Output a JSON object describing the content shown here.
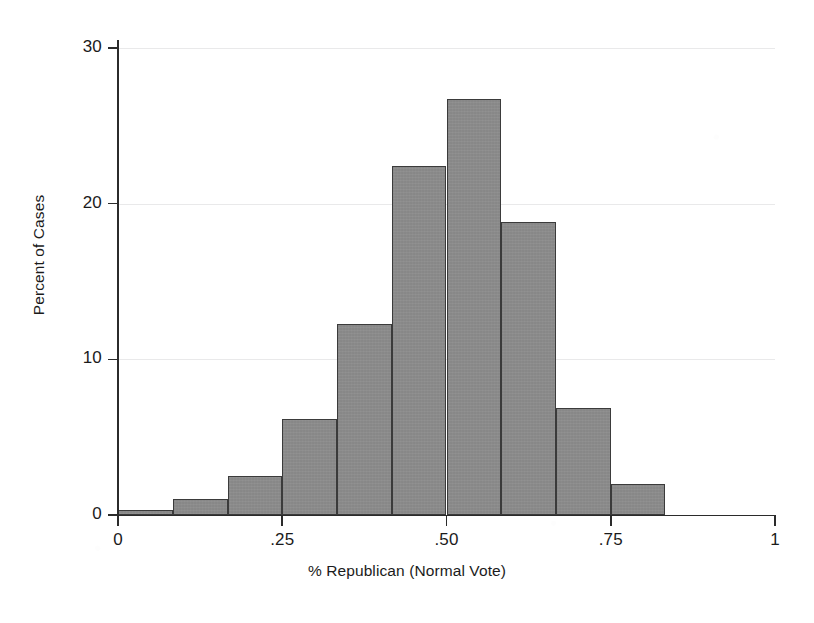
{
  "chart_data": {
    "type": "bar",
    "title": "",
    "subtitle": "",
    "xlabel": "% Republican (Normal Vote)",
    "ylabel": "Percent of Cases",
    "xlim": [
      0,
      1
    ],
    "ylim": [
      0,
      30
    ],
    "grid": true,
    "legend": null,
    "bin_width": 0.0833,
    "x_ticks": [
      {
        "value": 0,
        "label": "0"
      },
      {
        "value": 0.25,
        "label": ".25"
      },
      {
        "value": 0.5,
        "label": ".50"
      },
      {
        "value": 0.75,
        "label": ".75"
      },
      {
        "value": 1,
        "label": "1"
      }
    ],
    "y_ticks": [
      {
        "value": 0,
        "label": "0"
      },
      {
        "value": 10,
        "label": "10"
      },
      {
        "value": 20,
        "label": "20"
      },
      {
        "value": 30,
        "label": "30"
      }
    ],
    "bars": [
      {
        "x_start": 0.0,
        "x_end": 0.0833,
        "value": 0.3
      },
      {
        "x_start": 0.0833,
        "x_end": 0.1667,
        "value": 1.0
      },
      {
        "x_start": 0.1667,
        "x_end": 0.25,
        "value": 2.5
      },
      {
        "x_start": 0.25,
        "x_end": 0.3333,
        "value": 6.2
      },
      {
        "x_start": 0.3333,
        "x_end": 0.4167,
        "value": 12.3
      },
      {
        "x_start": 0.4167,
        "x_end": 0.5,
        "value": 22.4
      },
      {
        "x_start": 0.5,
        "x_end": 0.5833,
        "value": 26.7
      },
      {
        "x_start": 0.5833,
        "x_end": 0.6667,
        "value": 18.8
      },
      {
        "x_start": 0.6667,
        "x_end": 0.75,
        "value": 6.9
      },
      {
        "x_start": 0.75,
        "x_end": 0.8333,
        "value": 2.0
      }
    ],
    "categories": [
      "0–.083",
      ".083–.167",
      ".167–.25",
      ".25–.333",
      ".333–.417",
      ".417–.50",
      ".50–.583",
      ".583–.667",
      ".667–.75",
      ".75–.833"
    ],
    "values": [
      0.3,
      1.0,
      2.5,
      6.2,
      12.3,
      22.4,
      26.7,
      18.8,
      6.9,
      2.0
    ],
    "colors": {
      "bar_fill": "#8b8b8b",
      "bar_edge": "#3b3b3b",
      "axis": "#2b2b2b",
      "gridline": "#e9e9ea",
      "background": "#ffffff",
      "text": "#1b1b1b"
    }
  },
  "page": {
    "caption_fragment": "caption text below figure"
  }
}
